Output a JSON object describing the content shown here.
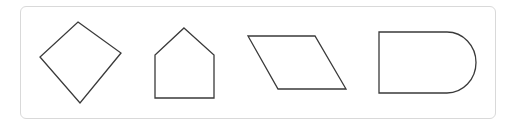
{
  "panel": {
    "border_color": "#d9d9d9",
    "background": "#ffffff"
  },
  "shapes": [
    {
      "name": "diamond",
      "type": "quadrilateral",
      "points": "78,22 121,53 80,103 40,57"
    },
    {
      "name": "pentagon-house",
      "type": "pentagon",
      "points": "184,28 214,55 214,98 155,98 155,55"
    },
    {
      "name": "parallelogram",
      "type": "parallelogram",
      "points": "248,36 315,36 346,89 278,89"
    },
    {
      "name": "d-shape",
      "type": "rounded-end-rectangle",
      "path": "M379,32 L447,32 A29,30.5 0 0 1 447,93 L379,93 Z"
    }
  ],
  "stroke_color": "#3a3a3a"
}
